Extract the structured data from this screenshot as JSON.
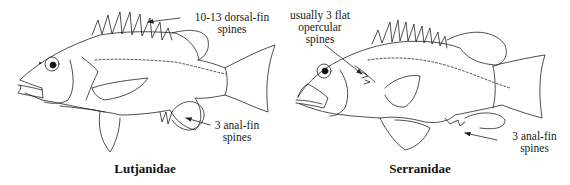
{
  "figures": [
    {
      "name": "Lutjanidae",
      "caption": "Lutjanidae",
      "annotations": {
        "dorsal": {
          "line1": "10-13 dorsal-fin",
          "line2": "spines"
        },
        "anal": {
          "line1": "3 anal-fin",
          "line2": "spines"
        }
      }
    },
    {
      "name": "Serranidae",
      "caption": "Serranidae",
      "annotations": {
        "opercular": {
          "line1": "usually 3 flat",
          "line2": "opercular",
          "line3": "spines"
        },
        "anal": {
          "line1": "3 anal-fin",
          "line2": "spines"
        }
      }
    }
  ],
  "colors": {
    "line": "#222222",
    "background": "#ffffff"
  }
}
